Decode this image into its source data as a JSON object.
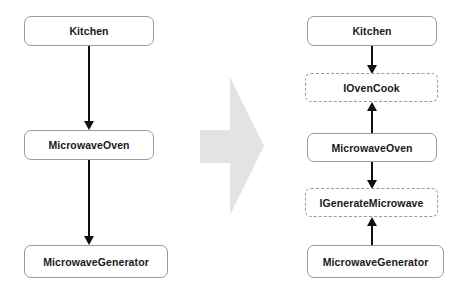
{
  "diagram": {
    "colors": {
      "box_border": "#9a9a9a",
      "interface_border": "#9b9b9b",
      "arrow": "#111111",
      "big_arrow_fill": "#e3e3e3",
      "background": "#ffffff",
      "text": "#1a1a1a"
    },
    "before": {
      "caption": "",
      "nodes": [
        {
          "id": "kitchen",
          "label": "Kitchen",
          "kind": "concrete"
        },
        {
          "id": "microwave_oven",
          "label": "MicrowaveOven",
          "kind": "concrete"
        },
        {
          "id": "microwave_generator",
          "label": "MicrowaveGenerator",
          "kind": "concrete"
        }
      ],
      "edges": [
        {
          "from": "Kitchen",
          "to": "MicrowaveOven",
          "direction": "down"
        },
        {
          "from": "MicrowaveOven",
          "to": "MicrowaveGenerator",
          "direction": "down"
        }
      ]
    },
    "transform": {
      "icon": "block-arrow-right-icon",
      "direction": "right"
    },
    "after": {
      "caption": "",
      "nodes": [
        {
          "id": "kitchen2",
          "label": "Kitchen",
          "kind": "concrete"
        },
        {
          "id": "iovencook",
          "label": "IOvenCook",
          "kind": "interface"
        },
        {
          "id": "microwave_oven2",
          "label": "MicrowaveOven",
          "kind": "concrete"
        },
        {
          "id": "igeneratemicrowave",
          "label": "IGenerateMicrowave",
          "kind": "interface"
        },
        {
          "id": "microwave_generator2",
          "label": "MicrowaveGenerator",
          "kind": "concrete"
        }
      ],
      "edges": [
        {
          "from": "Kitchen",
          "to": "IOvenCook",
          "direction": "down"
        },
        {
          "from": "MicrowaveOven",
          "to": "IOvenCook",
          "direction": "up"
        },
        {
          "from": "MicrowaveOven",
          "to": "IGenerateMicrowave",
          "direction": "down"
        },
        {
          "from": "MicrowaveGenerator",
          "to": "IGenerateMicrowave",
          "direction": "up"
        }
      ]
    }
  }
}
